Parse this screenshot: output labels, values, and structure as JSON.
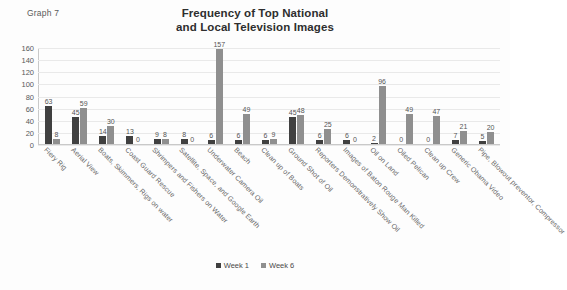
{
  "graph_label": "Graph 7",
  "title_lines": [
    "Frequency of Top National",
    "and Local Television Images"
  ],
  "legend": {
    "items": [
      {
        "label": "Week 1",
        "color": "#404040"
      },
      {
        "label": "Week 6",
        "color": "#8f8f8f"
      }
    ]
  },
  "chart_data": {
    "type": "bar",
    "title": "Frequency of Top National and Local Television Images",
    "xlabel": "",
    "ylabel": "",
    "ylim": [
      0,
      160
    ],
    "yticks": [
      0,
      20,
      40,
      60,
      80,
      100,
      120,
      140,
      160
    ],
    "grid": true,
    "legend_position": "bottom",
    "categories": [
      "Fiery Rig",
      "Aerial View",
      "Boats, Skimmers, Rigs on water",
      "Coast Guard Rescue",
      "Shrimpers and Fishers on Water",
      "Satellite, Space, and Google Earth",
      "Underwater Camera Oil",
      "Beach",
      "Clean up of Boats",
      "Ground Shot of Oil",
      "Reporters Demonstratively Show Oil",
      "Images of Baton Rouge Man Killed",
      "Oil on Land",
      "Oiled Pelican",
      "Clean up Crew",
      "Generic Obama Video",
      "Pipe, Blowout preventor, Compressor"
    ],
    "series": [
      {
        "name": "Week 1",
        "color": "#404040",
        "values": [
          63,
          45,
          14,
          13,
          9,
          8,
          6,
          6,
          6,
          45,
          6,
          6,
          2,
          0,
          0,
          7,
          5
        ]
      },
      {
        "name": "Week 6",
        "color": "#8f8f8f",
        "values": [
          8,
          59,
          30,
          0,
          8,
          0,
          157,
          49,
          9,
          48,
          25,
          0,
          96,
          49,
          47,
          21,
          20
        ]
      }
    ]
  }
}
